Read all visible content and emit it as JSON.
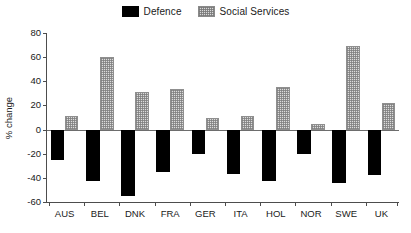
{
  "legend": {
    "position": "top-center",
    "entries": [
      {
        "label": "Defence",
        "swatch": "defence",
        "color": "#000000"
      },
      {
        "label": "Social Services",
        "swatch": "social",
        "color": "#dcdcdc"
      }
    ]
  },
  "axes": {
    "ylabel": "% change",
    "xlabel": "",
    "yticks": [
      80,
      60,
      40,
      20,
      0,
      -20,
      -40,
      -60
    ],
    "ytick_labels": [
      "80",
      "60",
      "40",
      "20",
      "0",
      "-20",
      "-40",
      "-60"
    ],
    "ylim": [
      -60,
      80
    ],
    "grid": false
  },
  "chart_data": {
    "type": "bar",
    "title": "",
    "subtitle": "",
    "xlabel": "",
    "ylabel": "% change",
    "ylim": [
      -60,
      80
    ],
    "grid": false,
    "legend_position": "top-center",
    "categories": [
      "AUS",
      "BEL",
      "DNK",
      "FRA",
      "GER",
      "ITA",
      "HOL",
      "NOR",
      "SWE",
      "UK"
    ],
    "series": [
      {
        "name": "Defence",
        "color": "#000000",
        "values": [
          -25,
          -43,
          -55,
          -35,
          -20,
          -37,
          -43,
          -20,
          -44,
          -38
        ]
      },
      {
        "name": "Social Services",
        "color": "#dcdcdc",
        "values": [
          11,
          60,
          31,
          34,
          10,
          11,
          35,
          5,
          69,
          22
        ]
      }
    ]
  }
}
